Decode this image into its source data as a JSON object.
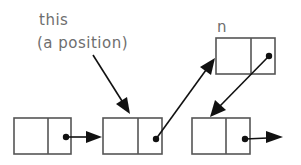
{
  "diagram": {
    "type": "linked-list",
    "labels": {
      "this_line1": "this",
      "this_line2": "(a position)",
      "new_node": "n"
    },
    "nodes": [
      {
        "id": "node-1",
        "x": 14,
        "y": 118,
        "w": 57,
        "h": 36,
        "divider_x": 48
      },
      {
        "id": "node-2",
        "x": 103,
        "y": 118,
        "w": 59,
        "h": 36,
        "divider_x": 138
      },
      {
        "id": "node-n",
        "x": 216,
        "y": 38,
        "w": 59,
        "h": 36,
        "divider_x": 251
      },
      {
        "id": "node-3",
        "x": 192,
        "y": 118,
        "w": 58,
        "h": 36,
        "divider_x": 226
      }
    ],
    "edges": [
      {
        "from": "node-1",
        "to": "node-2"
      },
      {
        "from": "node-2",
        "to": "node-n"
      },
      {
        "from": "node-n",
        "to": "node-3"
      },
      {
        "from": "node-3",
        "to": "next"
      },
      {
        "from": "this",
        "to": "node-2"
      }
    ],
    "colors": {
      "box_stroke": "#555555",
      "arrow": "#111111",
      "label": "#6e6e6e"
    }
  }
}
